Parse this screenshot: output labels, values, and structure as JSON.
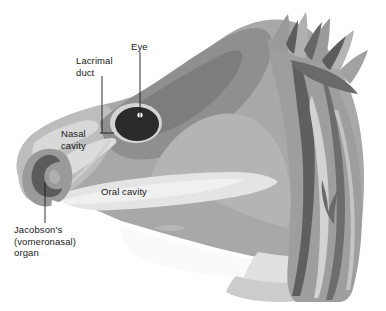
{
  "figure": {
    "background_color": "#ffffff",
    "width": 386,
    "height": 311
  },
  "labels": {
    "lacrimal_duct": "Lacrimal\nduct",
    "eye": "Eye",
    "nasal_cavity": "Nasal\ncavity",
    "oral_cavity": "Oral cavity",
    "jacobsons_organ": "Jacobson's\n(vomeronasal)\norgan"
  },
  "colors": {
    "background": "#ffffff",
    "very_light_gray": "#eeeeee",
    "light_gray": "#d8d8d8",
    "pale_gray": "#c9c9c9",
    "mid_light_gray": "#bdbdbd",
    "mid_gray": "#a8a8a8",
    "mid_dark_gray": "#9a9a9a",
    "dark_gray": "#7d7d7d",
    "darker_gray": "#6a6a6a",
    "eye_black": "#2b2b2b",
    "eye_highlight": "#ffffff",
    "leader_line": "#1a1a1a",
    "text": "#1a1a1a"
  },
  "leader_lines": [
    {
      "name": "lacrimal-duct-leader",
      "x1": 102,
      "y1": 76,
      "x2": 102,
      "y2": 133
    },
    {
      "name": "eye-leader",
      "x1": 140,
      "y1": 52,
      "x2": 140,
      "y2": 121
    },
    {
      "name": "nasal-cavity-pointer",
      "x1": 100,
      "y1": 133,
      "x2": 113,
      "y2": 133
    },
    {
      "name": "jacobsons-organ-leader",
      "x1": 45,
      "y1": 182,
      "x2": 45,
      "y2": 223
    }
  ],
  "structures": [
    "head-outline",
    "crest-spikes",
    "eye",
    "eye-highlight",
    "nasal-cavity",
    "oral-cavity",
    "jacobsons-organ",
    "lower-jaw",
    "neck-scales"
  ]
}
